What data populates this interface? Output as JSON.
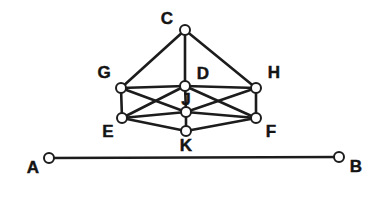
{
  "figure": {
    "background_color": "#ffffff",
    "edge_color": "#1c1c1c",
    "node_fill": "#ffffff",
    "node_stroke": "#1c1c1c",
    "label_color": "#141414",
    "node_radius": 5,
    "edge_width": 2.6,
    "baseline_edge_width": 2.4,
    "node_stroke_width": 2.0
  },
  "nodes": [
    {
      "id": "C",
      "label": "C",
      "x": 185,
      "y": 30,
      "label_x": 167,
      "label_y": 20,
      "label_pos": "left-above"
    },
    {
      "id": "G",
      "label": "G",
      "x": 121,
      "y": 88,
      "label_x": 104,
      "label_y": 74,
      "label_pos": "left-above"
    },
    {
      "id": "D",
      "label": "D",
      "x": 185,
      "y": 86,
      "label_x": 203,
      "label_y": 75,
      "label_pos": "right-above"
    },
    {
      "id": "H",
      "label": "H",
      "x": 256,
      "y": 88,
      "label_x": 274,
      "label_y": 74,
      "label_pos": "right-above"
    },
    {
      "id": "J",
      "label": "J",
      "x": 186,
      "y": 112,
      "label_x": 186,
      "label_y": 101,
      "label_pos": "above"
    },
    {
      "id": "E",
      "label": "E",
      "x": 122,
      "y": 118,
      "label_x": 108,
      "label_y": 133,
      "label_pos": "left-below"
    },
    {
      "id": "F",
      "label": "F",
      "x": 256,
      "y": 118,
      "label_x": 271,
      "label_y": 133,
      "label_pos": "right-below"
    },
    {
      "id": "K",
      "label": "K",
      "x": 186,
      "y": 131,
      "label_x": 186,
      "label_y": 147,
      "label_pos": "below"
    },
    {
      "id": "A",
      "label": "A",
      "x": 49,
      "y": 158,
      "label_x": 33,
      "label_y": 169,
      "label_pos": "left-below"
    },
    {
      "id": "B",
      "label": "B",
      "x": 339,
      "y": 157,
      "label_x": 356,
      "label_y": 168,
      "label_pos": "right-below"
    }
  ],
  "edges": [
    {
      "id": "C-G",
      "from": "C",
      "to": "G",
      "kind": "solid"
    },
    {
      "id": "C-D",
      "from": "C",
      "to": "D",
      "kind": "solid"
    },
    {
      "id": "C-H",
      "from": "C",
      "to": "H",
      "kind": "solid"
    },
    {
      "id": "G-D",
      "from": "G",
      "to": "D",
      "kind": "solid"
    },
    {
      "id": "D-H",
      "from": "D",
      "to": "H",
      "kind": "solid"
    },
    {
      "id": "G-E",
      "from": "G",
      "to": "E",
      "kind": "solid"
    },
    {
      "id": "H-F",
      "from": "H",
      "to": "F",
      "kind": "solid"
    },
    {
      "id": "G-J",
      "from": "G",
      "to": "J",
      "kind": "solid"
    },
    {
      "id": "H-J",
      "from": "H",
      "to": "J",
      "kind": "solid"
    },
    {
      "id": "E-D",
      "from": "E",
      "to": "D",
      "kind": "solid"
    },
    {
      "id": "F-D",
      "from": "F",
      "to": "D",
      "kind": "solid"
    },
    {
      "id": "E-J",
      "from": "E",
      "to": "J",
      "kind": "solid"
    },
    {
      "id": "F-J",
      "from": "F",
      "to": "J",
      "kind": "solid"
    },
    {
      "id": "D-J",
      "from": "D",
      "to": "J",
      "kind": "solid"
    },
    {
      "id": "J-K",
      "from": "J",
      "to": "K",
      "kind": "solid"
    },
    {
      "id": "E-K",
      "from": "E",
      "to": "K",
      "kind": "solid"
    },
    {
      "id": "F-K",
      "from": "F",
      "to": "K",
      "kind": "solid"
    },
    {
      "id": "A-B",
      "from": "A",
      "to": "B",
      "kind": "baseline"
    }
  ]
}
